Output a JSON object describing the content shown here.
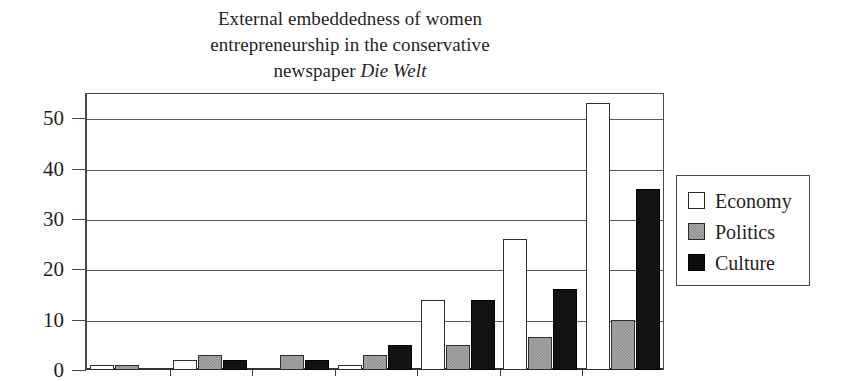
{
  "chart_data": {
    "type": "bar",
    "title": "External embeddedness of women entrepreneurship in the conservative newspaper Die Welt",
    "title_lines": [
      "External embeddedness of women",
      "entrepreneurship in the conservative",
      "newspaper "
    ],
    "title_italic_tail": "Die Welt",
    "xlabel": "",
    "ylabel": "",
    "ylim": [
      0,
      55
    ],
    "ytick_labels": [
      "0",
      "10",
      "20",
      "30",
      "40",
      "50"
    ],
    "ytick_values": [
      0,
      10,
      20,
      30,
      40,
      50
    ],
    "grid": true,
    "grid_axis": "y",
    "legend_position": "right",
    "categories": [
      "1",
      "2",
      "3",
      "4",
      "5",
      "6",
      "7"
    ],
    "series": [
      {
        "name": "Economy",
        "color": "#ffffff",
        "values": [
          1,
          2,
          0,
          1,
          14,
          26,
          53
        ]
      },
      {
        "name": "Politics",
        "color": "#8d8d8d",
        "values": [
          1,
          3,
          3,
          3,
          5,
          6.5,
          10
        ]
      },
      {
        "name": "Culture",
        "color": "#121212",
        "values": [
          0,
          2,
          2,
          5,
          14,
          16,
          36
        ]
      }
    ]
  },
  "legend": {
    "items": [
      {
        "label": "Economy",
        "swatch": "economy-swatch"
      },
      {
        "label": "Politics",
        "swatch": "politics-swatch"
      },
      {
        "label": "Culture",
        "swatch": "culture-swatch"
      }
    ]
  }
}
